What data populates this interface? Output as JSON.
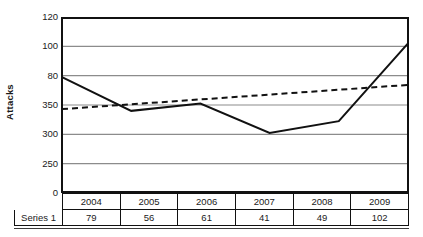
{
  "chart_data": {
    "type": "line",
    "title": "",
    "xlabel": "",
    "ylabel": "Attacks",
    "categories": [
      "2004",
      "2005",
      "2006",
      "2007",
      "2008",
      "2009"
    ],
    "series": [
      {
        "name": "Series 1",
        "style": "solid",
        "values": [
          79,
          56,
          61,
          41,
          49,
          102
        ]
      },
      {
        "name": "Linear trendline",
        "style": "dashed",
        "values": [
          57.2,
          60.5,
          63.8,
          67.1,
          70.4,
          73.7
        ]
      }
    ],
    "y_tick_labels": [
      "120",
      "100",
      "80",
      "350",
      "300",
      "250",
      "0"
    ],
    "y_tick_plot_values": [
      120,
      100,
      80,
      60,
      40,
      20,
      0
    ],
    "ylim": [
      0,
      120
    ],
    "grid": true,
    "legend": "none",
    "note": "Y tick labels as printed in source: 120, 100, 80, 350, 300, 250, 0"
  },
  "table": {
    "row_label": "Series 1",
    "header_corner": "",
    "columns": [
      "2004",
      "2005",
      "2006",
      "2007",
      "2008",
      "2009"
    ],
    "values": [
      "79",
      "56",
      "61",
      "41",
      "49",
      "102"
    ]
  },
  "colors": {
    "axis": "#111111",
    "gridline": "#8c8c8c",
    "series_line": "#111111",
    "trendline": "#111111",
    "text": "#1a1a1a",
    "background": "#ffffff"
  }
}
